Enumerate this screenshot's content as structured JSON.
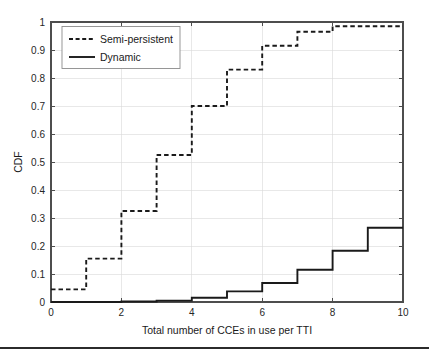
{
  "figure": {
    "background": "#ffffff",
    "line_color": "#1a1a1a",
    "grid_color": "#d9d9d9",
    "axis_color": "#4d4d4d"
  },
  "chart_data": {
    "type": "line",
    "title": "",
    "subtitle": "",
    "xlabel": "Total number of CCEs in use per TTI",
    "ylabel": "CDF",
    "xlim": [
      0,
      10
    ],
    "ylim": [
      0,
      1
    ],
    "xticks": [
      0,
      2,
      4,
      6,
      8,
      10
    ],
    "xtick_labels": [
      "0",
      "2",
      "4",
      "6",
      "8",
      "10"
    ],
    "yticks": [
      0,
      0.1,
      0.2,
      0.3,
      0.4,
      0.5,
      0.6,
      0.7,
      0.8,
      0.9,
      1
    ],
    "ytick_labels": [
      "0",
      "0.1",
      "0.2",
      "0.3",
      "0.4",
      "0.5",
      "0.6",
      "0.7",
      "0.8",
      "0.9",
      "1"
    ],
    "grid": true,
    "legend_position": "upper left",
    "legend_entries": [
      "Semi-persistent",
      "Dynamic"
    ],
    "x": [
      0,
      1,
      2,
      3,
      4,
      5,
      6,
      7,
      8,
      9,
      10
    ],
    "series": [
      {
        "name": "Semi-persistent",
        "style": "dashed",
        "values": [
          0.045,
          0.155,
          0.325,
          0.525,
          0.7,
          0.83,
          0.915,
          0.965,
          0.985,
          0.985,
          0.985
        ]
      },
      {
        "name": "Dynamic",
        "style": "solid",
        "values": [
          0.0,
          0.0,
          0.002,
          0.005,
          0.015,
          0.038,
          0.068,
          0.115,
          0.183,
          0.265,
          0.265
        ]
      }
    ]
  }
}
